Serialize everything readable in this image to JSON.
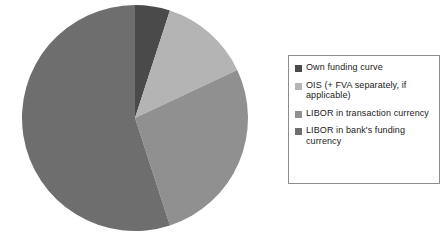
{
  "chart_data": {
    "type": "pie",
    "title": "",
    "subtitle": "",
    "xlabel": "",
    "ylabel": "",
    "grid": false,
    "legend_position": "right",
    "start_angle_deg": 0,
    "direction": "clockwise",
    "labels": [
      "Own funding curve",
      "OIS (+ FVA separately, if applicable)",
      "LIBOR in transaction currency",
      "LIBOR in bank's funding currency"
    ],
    "colors": [
      "#4a4a4a",
      "#b4b4b4",
      "#909090",
      "#6e6e6e"
    ],
    "values": [
      5,
      13,
      27,
      55
    ],
    "value_unit": "percent",
    "slice_angles_deg": [
      18,
      46.8,
      97.2,
      198
    ],
    "slices": [
      {
        "label": "Own funding curve",
        "value": 5,
        "color": "#4a4a4a",
        "start_deg": 0,
        "end_deg": 18
      },
      {
        "label": "OIS (+ FVA separately, if applicable)",
        "value": 13,
        "color": "#b4b4b4",
        "start_deg": 18,
        "end_deg": 64.8
      },
      {
        "label": "LIBOR in transaction currency",
        "value": 27,
        "color": "#909090",
        "start_deg": 64.8,
        "end_deg": 162
      },
      {
        "label": "LIBOR in bank's funding currency",
        "value": 55,
        "color": "#6e6e6e",
        "start_deg": 162,
        "end_deg": 360
      }
    ],
    "geometry": {
      "center_x": 135,
      "center_y": 118,
      "radius": 113
    }
  },
  "legend": {
    "items": [
      {
        "label": "Own funding curve",
        "color": "#4a4a4a"
      },
      {
        "label": "OIS (+ FVA separately, if applicable)",
        "color": "#b4b4b4"
      },
      {
        "label": "LIBOR in transaction currency",
        "color": "#909090"
      },
      {
        "label": "LIBOR in bank's funding currency",
        "color": "#6e6e6e"
      }
    ]
  }
}
